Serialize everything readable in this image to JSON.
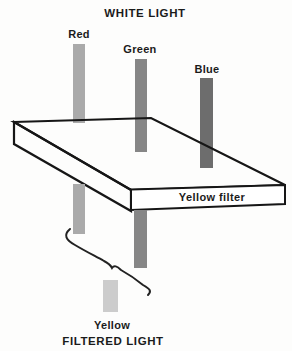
{
  "diagram": {
    "top_title": "WHITE LIGHT",
    "bottom_title": "FILTERED LIGHT",
    "filter": {
      "label": "Yellow filter",
      "face_color": "#ffffff",
      "line_color": "#161616"
    },
    "beams_in": [
      {
        "label": "Red",
        "color": "#aaaaaa"
      },
      {
        "label": "Green",
        "color": "#868686"
      },
      {
        "label": "Blue",
        "color": "#6d6d6d"
      }
    ],
    "beams_out": [
      {
        "label": "Red (transmitted)",
        "color": "#aaaaaa"
      },
      {
        "label": "Green (transmitted)",
        "color": "#868686"
      }
    ],
    "result": {
      "label": "Yellow",
      "color": "#cccccc"
    },
    "colors": {
      "background": "#fdfdfc",
      "text": "#1b1b1b",
      "brace": "#222222"
    }
  }
}
